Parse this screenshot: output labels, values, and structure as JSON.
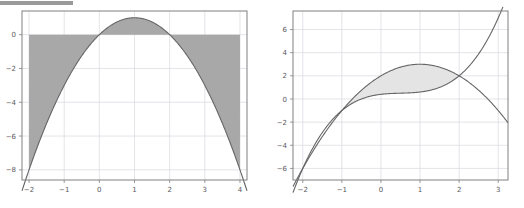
{
  "figure": {
    "background_color": "#ffffff",
    "top_rule_color": "#9a9a9a",
    "axis_color": "#808080",
    "grid_color": "#d8d8e0",
    "tick_label_color": "#58585e",
    "curve_color": "#666666"
  },
  "chart_data": [
    {
      "type": "area",
      "title": "",
      "xlabel": "",
      "ylabel": "",
      "xlim": [
        -2.2,
        4.2
      ],
      "ylim": [
        -8.6,
        1.4
      ],
      "xticks": [
        -2,
        -1,
        0,
        1,
        2,
        3,
        4
      ],
      "xticklabels": [
        "−2",
        "−1",
        "0",
        "1",
        "2",
        "3",
        "4"
      ],
      "yticks": [
        0,
        -2,
        -4,
        -6,
        -8
      ],
      "yticklabels": [
        "0",
        "−2",
        "−4",
        "−6",
        "−8"
      ],
      "grid": true,
      "legend": "none",
      "fill_color": "#a8a8a8",
      "fill_opacity": 1,
      "series": [
        {
          "name": "y = 2x - x^2",
          "expression": "2*x - x*x",
          "color": "#666666",
          "x": [
            -2,
            -1.75,
            -1.5,
            -1.25,
            -1,
            -0.75,
            -0.5,
            -0.25,
            0,
            0.25,
            0.5,
            0.75,
            1,
            1.25,
            1.5,
            1.75,
            2,
            2.25,
            2.5,
            2.75,
            3,
            3.25,
            3.5,
            3.75,
            4
          ],
          "y": [
            -8,
            -6.5625,
            -5.25,
            -4.0625,
            -3,
            -2.0625,
            -1.25,
            -0.5625,
            0,
            0.4375,
            0.75,
            0.9375,
            1,
            0.9375,
            0.75,
            0.4375,
            0,
            -0.5625,
            -1.25,
            -2.0625,
            -3,
            -4.0625,
            -5.25,
            -6.5625,
            -8
          ]
        },
        {
          "name": "y = 0 (baseline)",
          "expression": "0",
          "color": "#a8a8a8",
          "x": [
            -2,
            4
          ],
          "y": [
            0,
            0
          ]
        }
      ],
      "fill_between": {
        "lower": "y = 2x - x^2",
        "upper": "y = 0 (baseline)",
        "x_range": [
          -2,
          4
        ],
        "description": "region between the parabola and the horizontal line y = 0"
      }
    },
    {
      "type": "area",
      "title": "",
      "xlabel": "",
      "ylabel": "",
      "xlim": [
        -2.25,
        3.25
      ],
      "ylim": [
        -7.0,
        7.6
      ],
      "xticks": [
        -2,
        -1,
        0,
        1,
        2,
        3
      ],
      "xticklabels": [
        "−2",
        "−1",
        "0",
        "1",
        "2",
        "3"
      ],
      "yticks": [
        6,
        4,
        2,
        0,
        -2,
        -4,
        -6
      ],
      "yticklabels": [
        "6",
        "4",
        "2",
        "0",
        "−2",
        "−4",
        "−6"
      ],
      "grid": true,
      "legend": "none",
      "fill_color": "#e4e4e4",
      "fill_opacity": 1,
      "series": [
        {
          "name": "upper boundary: y = 2 + x - x^2/... (downward arc)",
          "expression": "3 - (x-1)*(x-1)",
          "color": "#666666",
          "x": [
            -2,
            -1.5,
            -1,
            -0.5,
            0,
            0.5,
            1,
            1.5,
            2,
            2.5,
            3
          ],
          "y": [
            -6,
            -3.25,
            -1,
            0.75,
            2,
            2.75,
            3,
            2.75,
            2,
            0.75,
            -1
          ]
        },
        {
          "name": "lower boundary: y = x^3/... (rising cubic)",
          "expression": "x*x*x/... rising through (-2,-6),(-1,-1),(0,-2),(1,-1),(2,2),(3,7)",
          "color": "#666666",
          "x": [
            -2,
            -1.5,
            -1,
            -0.5,
            0,
            0.5,
            1,
            1.5,
            2,
            2.5,
            3
          ],
          "y": [
            -6,
            -3.125,
            -1,
            -1.875,
            -2,
            -1.875,
            -1,
            1.375,
            2,
            4.125,
            7
          ]
        }
      ],
      "fill_between": {
        "lower": "lower boundary",
        "upper": "upper boundary",
        "x_range": [
          -1,
          2
        ],
        "description": "lens-shaped region between the two curves, bounded by their intersections at x = -1 and x = 2"
      }
    }
  ]
}
